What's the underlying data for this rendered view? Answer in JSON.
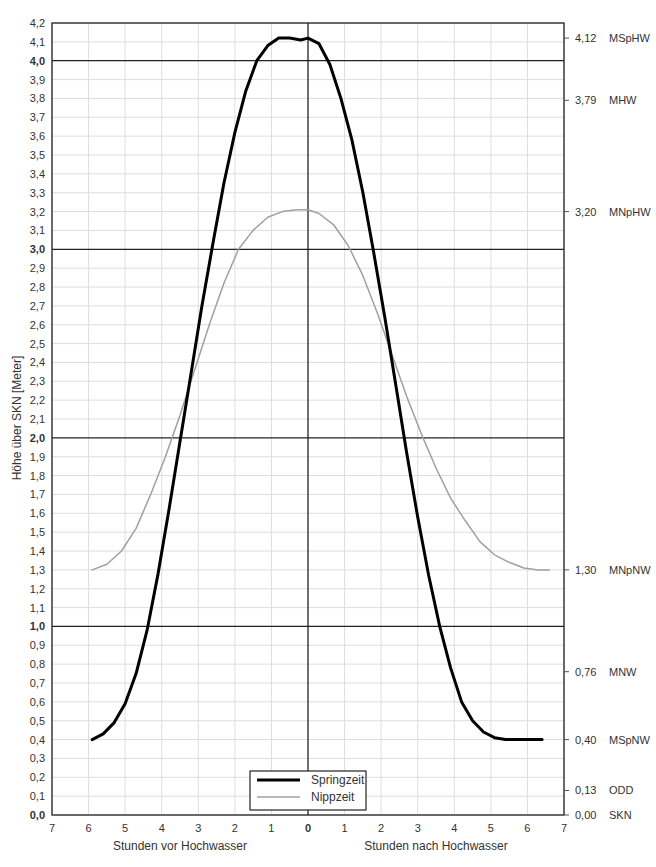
{
  "chart_data": {
    "type": "line",
    "title": "",
    "ylabel": "Höhe über SKN [Meter]",
    "xlabel_left": "Stunden vor Hochwasser",
    "xlabel_right": "Stunden nach Hochwasser",
    "x_range": [
      -7,
      7
    ],
    "ylim": [
      0.0,
      4.2
    ],
    "grid": true,
    "x_ticks": [
      -7,
      -6,
      -5,
      -4,
      -3,
      -2,
      -1,
      0,
      1,
      2,
      3,
      4,
      5,
      6,
      7
    ],
    "x_tick_labels": [
      "7",
      "6",
      "5",
      "4",
      "3",
      "2",
      "1",
      "0",
      "1",
      "2",
      "3",
      "4",
      "5",
      "6",
      "7"
    ],
    "y_ticks": [
      0.0,
      0.1,
      0.2,
      0.3,
      0.4,
      0.5,
      0.6,
      0.7,
      0.8,
      0.9,
      1.0,
      1.1,
      1.2,
      1.3,
      1.4,
      1.5,
      1.6,
      1.7,
      1.8,
      1.9,
      2.0,
      2.1,
      2.2,
      2.3,
      2.4,
      2.5,
      2.6,
      2.7,
      2.8,
      2.9,
      3.0,
      3.1,
      3.2,
      3.3,
      3.4,
      3.5,
      3.6,
      3.7,
      3.8,
      3.9,
      4.0,
      4.1,
      4.2
    ],
    "y_tick_labels": [
      "0,0",
      "0,1",
      "0,2",
      "0,3",
      "0,4",
      "0,5",
      "0,6",
      "0,7",
      "0,8",
      "0,9",
      "1,0",
      "1,1",
      "1,2",
      "1,3",
      "1,4",
      "1,5",
      "1,6",
      "1,7",
      "1,8",
      "1,9",
      "2,0",
      "2,1",
      "2,2",
      "2,3",
      "2,4",
      "2,5",
      "2,6",
      "2,7",
      "2,8",
      "2,9",
      "3,0",
      "3,1",
      "3,2",
      "3,3",
      "3,4",
      "3,5",
      "3,6",
      "3,7",
      "3,8",
      "3,9",
      "4,0",
      "4,1",
      "4,2"
    ],
    "y_bold_ticks": [
      0.0,
      1.0,
      2.0,
      3.0,
      4.0
    ],
    "legend": {
      "position": "bottom-center",
      "entries": [
        "Springzeit",
        "Nippzeit"
      ]
    },
    "series": [
      {
        "name": "Springzeit",
        "color": "#000000",
        "width": 3,
        "x": [
          -5.9,
          -5.6,
          -5.3,
          -5.0,
          -4.7,
          -4.4,
          -4.1,
          -3.8,
          -3.5,
          -3.2,
          -2.9,
          -2.6,
          -2.3,
          -2.0,
          -1.7,
          -1.4,
          -1.1,
          -0.8,
          -0.5,
          -0.2,
          0.0,
          0.3,
          0.6,
          0.9,
          1.2,
          1.5,
          1.8,
          2.1,
          2.4,
          2.7,
          3.0,
          3.3,
          3.6,
          3.9,
          4.2,
          4.5,
          4.8,
          5.1,
          5.4,
          5.7,
          6.0,
          6.4
        ],
        "values": [
          0.4,
          0.43,
          0.49,
          0.59,
          0.75,
          0.98,
          1.28,
          1.62,
          1.98,
          2.34,
          2.7,
          3.03,
          3.35,
          3.62,
          3.84,
          4.0,
          4.08,
          4.12,
          4.12,
          4.11,
          4.12,
          4.09,
          3.98,
          3.8,
          3.58,
          3.3,
          2.98,
          2.64,
          2.28,
          1.92,
          1.58,
          1.27,
          1.0,
          0.78,
          0.6,
          0.5,
          0.44,
          0.41,
          0.4,
          0.4,
          0.4,
          0.4
        ]
      },
      {
        "name": "Nippzeit",
        "color": "#a0a0a0",
        "width": 1.5,
        "x": [
          -5.9,
          -5.5,
          -5.1,
          -4.7,
          -4.3,
          -3.9,
          -3.5,
          -3.1,
          -2.7,
          -2.3,
          -1.9,
          -1.5,
          -1.1,
          -0.7,
          -0.3,
          0.0,
          0.3,
          0.7,
          1.1,
          1.5,
          1.9,
          2.3,
          2.7,
          3.1,
          3.5,
          3.9,
          4.3,
          4.7,
          5.1,
          5.5,
          5.9,
          6.3,
          6.6
        ],
        "values": [
          1.3,
          1.33,
          1.4,
          1.52,
          1.7,
          1.9,
          2.12,
          2.36,
          2.6,
          2.82,
          3.0,
          3.1,
          3.17,
          3.2,
          3.21,
          3.21,
          3.19,
          3.13,
          3.02,
          2.86,
          2.66,
          2.44,
          2.22,
          2.02,
          1.84,
          1.68,
          1.56,
          1.45,
          1.38,
          1.34,
          1.31,
          1.3,
          1.3
        ]
      }
    ],
    "reference_levels": [
      {
        "value": 4.12,
        "value_label": "4,12",
        "name": "MSpHW"
      },
      {
        "value": 3.79,
        "value_label": "3,79",
        "name": "MHW"
      },
      {
        "value": 3.2,
        "value_label": "3,20",
        "name": "MNpHW"
      },
      {
        "value": 1.3,
        "value_label": "1,30",
        "name": "MNpNW"
      },
      {
        "value": 0.76,
        "value_label": "0,76",
        "name": "MNW"
      },
      {
        "value": 0.4,
        "value_label": "0,40",
        "name": "MSpNW"
      },
      {
        "value": 0.13,
        "value_label": "0,13",
        "name": "ODD"
      },
      {
        "value": 0.0,
        "value_label": "0,00",
        "name": "SKN"
      }
    ]
  }
}
